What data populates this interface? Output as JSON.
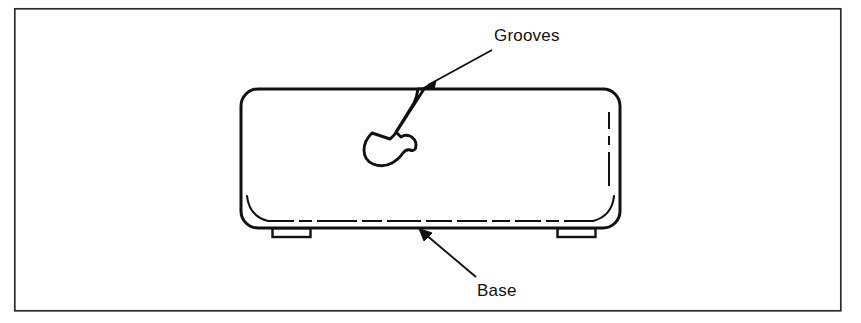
{
  "figure": {
    "type": "technical-line-drawing",
    "background_color": "#ffffff",
    "line_color": "#111111",
    "frame": {
      "name": "figure-border",
      "x": 14,
      "y": 8,
      "width": 827,
      "height": 303,
      "stroke_width": 1.6
    },
    "body": {
      "name": "appliance-body",
      "x": 241,
      "y": 89,
      "width": 379,
      "height": 139,
      "corner_radius": 16,
      "stroke_width": 3
    },
    "feet": [
      {
        "name": "foot-left",
        "x": 272,
        "y": 228,
        "width": 39,
        "height": 9
      },
      {
        "name": "foot-right",
        "x": 557,
        "y": 228,
        "width": 39,
        "height": 9
      }
    ],
    "groove_hook": {
      "name": "groove-hook-profile",
      "description": "hook shaped groove profile hanging from the top edge"
    },
    "inner_detail_lines": {
      "bottom_dashed": "dashed seam line above base edge",
      "right_dashed": "dashed seam line inside right edge",
      "corner_arcs": "inner rounded corner arcs at lower left and lower right"
    }
  },
  "callouts": [
    {
      "id": "grooves",
      "label": "Grooves",
      "label_x": 494,
      "label_y": 26,
      "leader": {
        "from_x": 492,
        "from_y": 50,
        "to_x": 424,
        "to_y": 88
      },
      "arrow_target": "top edge of appliance body at groove opening"
    },
    {
      "id": "base",
      "label": "Base",
      "label_x": 477,
      "label_y": 281,
      "leader": {
        "from_x": 476,
        "from_y": 276,
        "to_x": 420,
        "to_y": 229
      },
      "arrow_target": "bottom edge of appliance body"
    }
  ]
}
